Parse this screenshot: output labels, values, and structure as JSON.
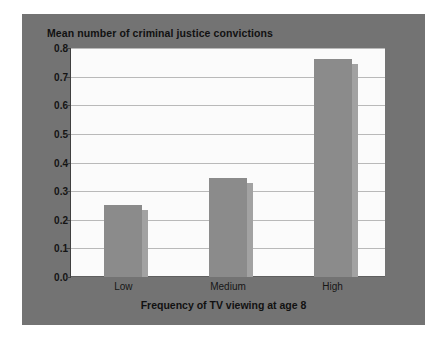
{
  "chart_data": {
    "type": "bar",
    "title": "Mean number of criminal justice convictions",
    "xlabel": "Frequency of TV viewing at age 8",
    "ylabel": "",
    "categories": [
      "Low",
      "Medium",
      "High"
    ],
    "values": [
      0.25,
      0.345,
      0.76
    ],
    "ylim": [
      0.0,
      0.8
    ],
    "ytick_labels": [
      "0.0",
      "0.1",
      "0.2",
      "0.3",
      "0.4",
      "0.5",
      "0.6",
      "0.7",
      "0.8"
    ],
    "ytick_values": [
      0.0,
      0.1,
      0.2,
      0.3,
      0.4,
      0.5,
      0.6,
      0.7,
      0.8
    ],
    "grid": true,
    "legend": false,
    "colors": {
      "figure_background": "#737373",
      "plot_background": "#fbfbfb",
      "bar": "#8b8b8b",
      "bar_shadow": "#a2a2a2",
      "gridline": "#b9b9b9",
      "axis": "#3f3f3f",
      "text": "#111111"
    }
  }
}
